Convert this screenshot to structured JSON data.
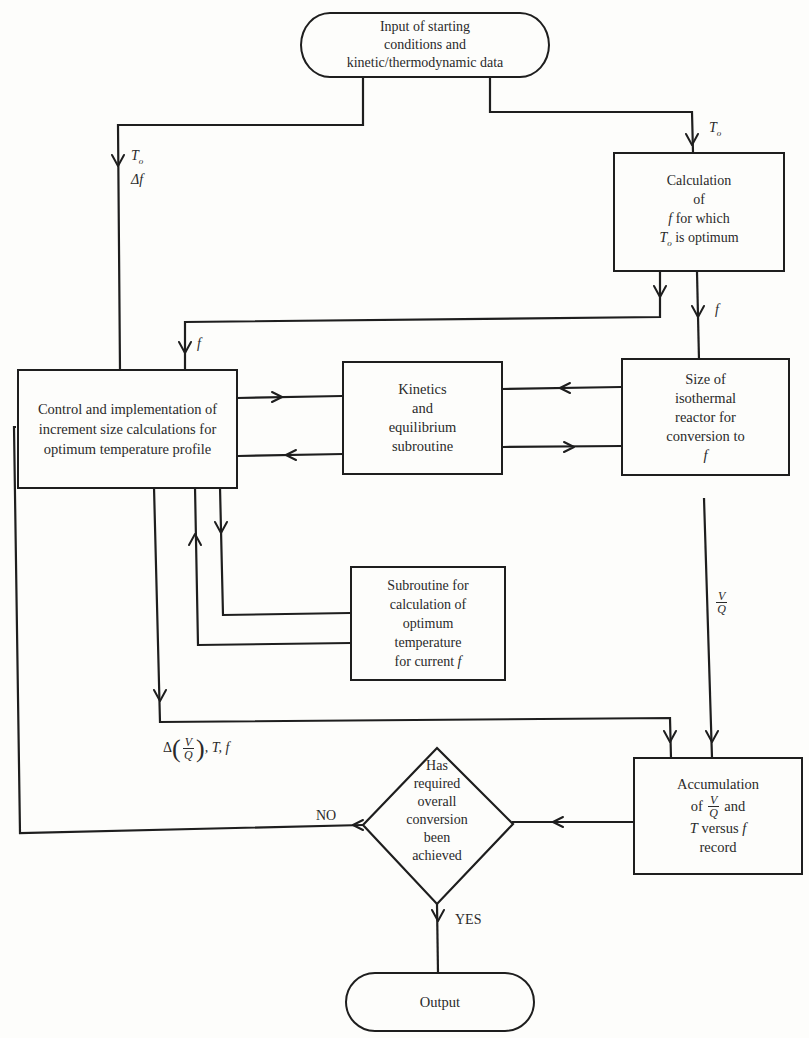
{
  "diagram": {
    "type": "flowchart",
    "nodes": {
      "input": {
        "shape": "terminal",
        "lines": [
          "Input of starting",
          "conditions and",
          "kinetic/thermodynamic data"
        ]
      },
      "calc_f": {
        "shape": "process",
        "lines": [
          "Calculation",
          "of",
          "for which",
          "is optimum"
        ],
        "vars": {
          "f": "f",
          "To": "T",
          "To_sub": "o"
        }
      },
      "control": {
        "shape": "process",
        "lines": [
          "Control and implementation of",
          "increment size calculations for",
          "optimum temperature profile"
        ]
      },
      "kinetics": {
        "shape": "process",
        "lines": [
          "Kinetics",
          "and",
          "equilibrium",
          "subroutine"
        ]
      },
      "isothermal": {
        "shape": "process",
        "lines": [
          "Size of",
          "isothermal",
          "reactor for",
          "conversion to",
          "f"
        ]
      },
      "opt_temp": {
        "shape": "process",
        "lines": [
          "Subroutine for",
          "calculation of",
          "optimum",
          "temperature",
          "for current"
        ],
        "var": "f"
      },
      "accumulation": {
        "shape": "process",
        "lines": [
          "Accumulation",
          "of",
          "and",
          "versus",
          "record"
        ],
        "frac": {
          "num": "V",
          "den": "Q"
        },
        "vars": {
          "T": "T",
          "f": "f"
        }
      },
      "decision": {
        "shape": "decision",
        "lines": [
          "Has",
          "required",
          "overall",
          "conversion",
          "been",
          "achieved"
        ]
      },
      "output": {
        "shape": "terminal",
        "lines": [
          "Output"
        ]
      }
    },
    "edge_labels": {
      "to_left_T": "T",
      "to_left_sub": "o",
      "delta_f": "Δf",
      "to_right_T": "T",
      "to_right_sub": "o",
      "f_left": "f",
      "f_right": "f",
      "vq_num": "V",
      "vq_den": "Q",
      "delta_prefix": "Δ",
      "delta_suffix": ", T, f",
      "no": "NO",
      "yes": "YES"
    }
  }
}
